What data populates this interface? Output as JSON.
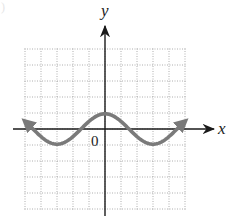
{
  "chart_data": {
    "type": "line",
    "title": "",
    "xlabel": "x",
    "ylabel": "y",
    "origin_label": "0",
    "xlim": [
      -5,
      5
    ],
    "ylim": [
      -5,
      5
    ],
    "grid": true,
    "grid_style": "dotted",
    "tick_labels": [],
    "legend": null,
    "series": [
      {
        "name": "curve",
        "function": "y = cos(pi*x/3)",
        "color": "#7a7a7a",
        "arrows_at_ends": true,
        "x": [
          -5,
          -4,
          -3,
          -2,
          -1.5,
          -1,
          0,
          1,
          1.5,
          2,
          3,
          4,
          5
        ],
        "y": [
          0.5,
          -0.5,
          -1,
          -0.5,
          0,
          0.5,
          1,
          0.5,
          0,
          -0.5,
          -1,
          -0.5,
          0.5
        ]
      }
    ],
    "key_points": {
      "maximum": [
        0,
        1
      ],
      "minima": [
        [
          -3,
          -1
        ],
        [
          3,
          -1
        ]
      ],
      "x_intercepts": [
        -4.5,
        -1.5,
        1.5,
        4.5
      ]
    }
  },
  "labels": {
    "x_axis": "x",
    "y_axis": "y",
    "origin": "0",
    "corner_mark": ")"
  },
  "colors": {
    "axis": "#1a1a1a",
    "curve": "#7a7a7a",
    "grid": "#9a9a9a"
  }
}
